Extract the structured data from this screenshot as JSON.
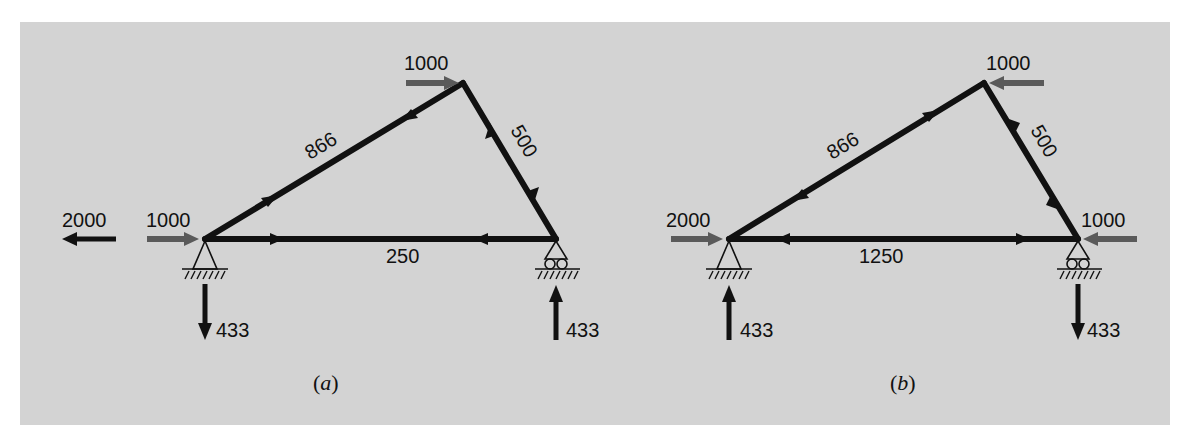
{
  "figure": {
    "background_color": "#d3d3d3",
    "load_arrow_color": "#5a5a5a",
    "member_color": "#111111",
    "panels": [
      {
        "id": "a",
        "caption_open": "(",
        "caption_letter": "a",
        "caption_close": ")",
        "members": {
          "inclined_left": "866",
          "inclined_right": "500",
          "bottom_chord": "250"
        },
        "applied_loads": {
          "apex_horizontal": "1000",
          "left_node_horizontal": "1000"
        },
        "reactions": {
          "left_horizontal": "2000",
          "left_vertical": "433",
          "right_vertical": "433"
        }
      },
      {
        "id": "b",
        "caption_open": "(",
        "caption_letter": "b",
        "caption_close": ")",
        "members": {
          "inclined_left": "866",
          "inclined_right": "500",
          "bottom_chord": "1250"
        },
        "applied_loads": {
          "apex_horizontal": "1000",
          "left_node_horizontal": "2000",
          "right_node_horizontal": "1000"
        },
        "reactions": {
          "left_vertical": "433",
          "right_vertical": "433"
        }
      }
    ]
  }
}
